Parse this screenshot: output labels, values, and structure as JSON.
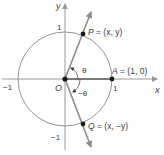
{
  "diagram": {
    "type": "unit-circle",
    "axes": {
      "x_label": "x",
      "y_label": "y"
    },
    "ticks": {
      "x_pos": "1",
      "x_neg": "−1",
      "y_pos": "1",
      "y_neg": "−1"
    },
    "origin_label": "O",
    "points": {
      "P": {
        "name": "P",
        "coords": "= (x, y)"
      },
      "A": {
        "name": "A",
        "coords": "= (1, 0)"
      },
      "Q": {
        "name": "Q",
        "coords": "= (x, −y)"
      }
    },
    "angles": {
      "positive": "θ",
      "negative": "−θ"
    },
    "colors": {
      "line": "#8c8c8c",
      "ray": "#7a7a7a",
      "axis": "#9a9a9a",
      "point": "#1a1a1a",
      "text": "#3a3a3a"
    }
  }
}
